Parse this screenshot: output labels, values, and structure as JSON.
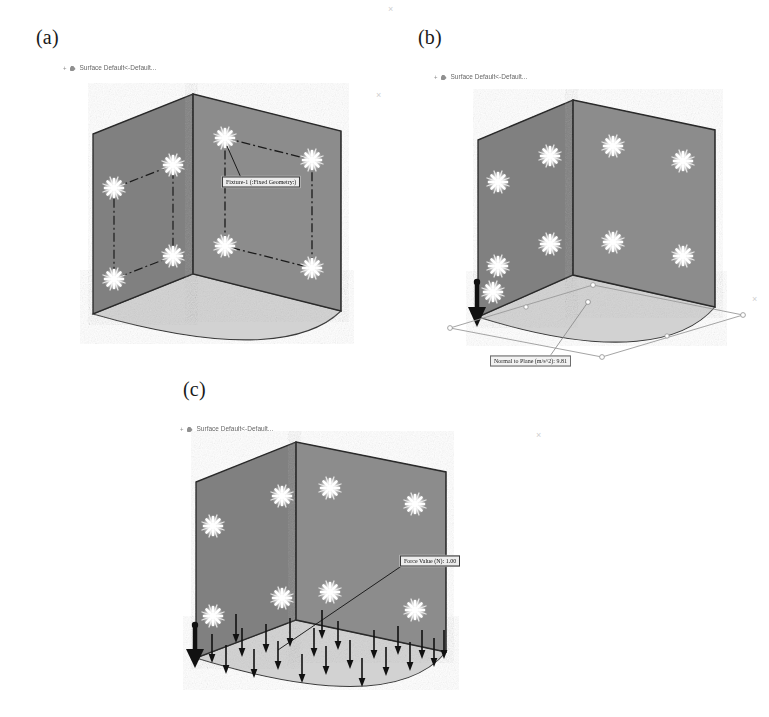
{
  "figure": {
    "caption_style": "(a) (b) (c)",
    "background_color": "#ffffff"
  },
  "panels": [
    {
      "id": "a",
      "letter": "(a)",
      "description": "Fixed geometry restraints applied at box corners",
      "tree": {
        "expander": "+",
        "icon": "surface-body-icon",
        "label": "Surface Default<-Default..."
      },
      "callout": {
        "text": "Fixture-1 (:Fixed Geometry:)",
        "kind": "fixture"
      },
      "restraint_marker_count": 8,
      "has_dash_dot_outline": true,
      "has_gravity_arrow": false,
      "has_force_arrows": false
    },
    {
      "id": "b",
      "letter": "(b)",
      "description": "Gravity load normal to plane applied to the model",
      "tree": {
        "expander": "+",
        "icon": "surface-body-icon",
        "label": "Surface Default<-Default..."
      },
      "callout": {
        "text": "Normal to Plane (m/s^2): 9.81",
        "kind": "gravity"
      },
      "restraint_marker_count": 9,
      "has_dash_dot_outline": false,
      "has_gravity_arrow": true,
      "has_force_arrows": false
    },
    {
      "id": "c",
      "letter": "(c)",
      "description": "Distributed downward force applied on the bottom face",
      "tree": {
        "expander": "+",
        "icon": "surface-body-icon",
        "label": "Surface Default<-Default..."
      },
      "callout": {
        "text": "Force Value (N): 1.00",
        "kind": "force"
      },
      "restraint_marker_count": 8,
      "has_dash_dot_outline": false,
      "has_gravity_arrow": true,
      "has_force_arrows": true,
      "force_arrow_count": 22
    }
  ],
  "colors": {
    "face_front": "#8a8a8a",
    "face_side": "#7f7f7f",
    "face_top_edge": "#6b6b6b",
    "floor": "#d2d2d2",
    "outline": "#2b2b2b",
    "restraint_marker": "#fdfdfd",
    "callout_fill": "#f0f0f0",
    "callout_border": "#5c5c5c",
    "arrow": "#111111",
    "page_background": "#ffffff"
  },
  "ghost_marks": [
    {
      "glyph": "×",
      "x": 390,
      "y": 10
    },
    {
      "glyph": "×",
      "x": 378,
      "y": 96
    },
    {
      "glyph": "×",
      "x": 760,
      "y": 300
    },
    {
      "glyph": "×",
      "x": 540,
      "y": 437
    }
  ]
}
